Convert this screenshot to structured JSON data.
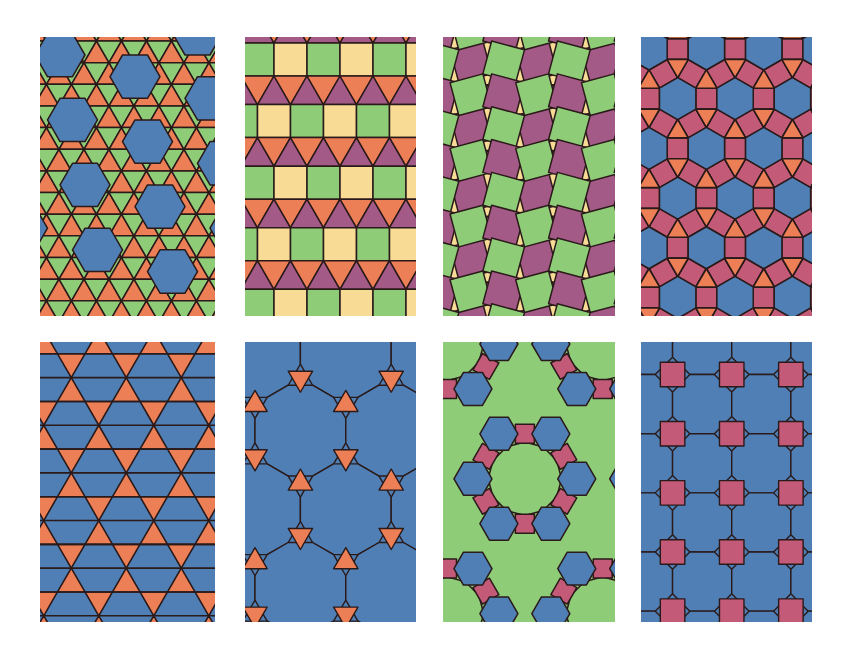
{
  "colors": {
    "blue": "#4f7fb5",
    "orange": "#ec7f55",
    "green": "#8fcc78",
    "cream": "#f8dc96",
    "purple": "#a45a86",
    "pink": "#c25a78",
    "stroke": "#2a1a1a"
  },
  "tilings": [
    {
      "id": "snub-hexagonal",
      "vertex_config": "3.3.3.3.6",
      "row": 0,
      "col": 0
    },
    {
      "id": "elongated-triangular",
      "vertex_config": "3.3.3.4.4",
      "row": 0,
      "col": 1
    },
    {
      "id": "snub-square",
      "vertex_config": "3.3.4.3.4",
      "row": 0,
      "col": 2
    },
    {
      "id": "rhombitrihexagonal",
      "vertex_config": "3.4.6.4",
      "row": 0,
      "col": 3
    },
    {
      "id": "trihexagonal",
      "vertex_config": "3.6.3.6",
      "row": 1,
      "col": 0
    },
    {
      "id": "truncated-hexagonal",
      "vertex_config": "3.12.12",
      "row": 1,
      "col": 1
    },
    {
      "id": "truncated-trihexagonal",
      "vertex_config": "4.6.12",
      "row": 1,
      "col": 2
    },
    {
      "id": "truncated-square",
      "vertex_config": "4.8.8",
      "row": 1,
      "col": 3
    }
  ]
}
